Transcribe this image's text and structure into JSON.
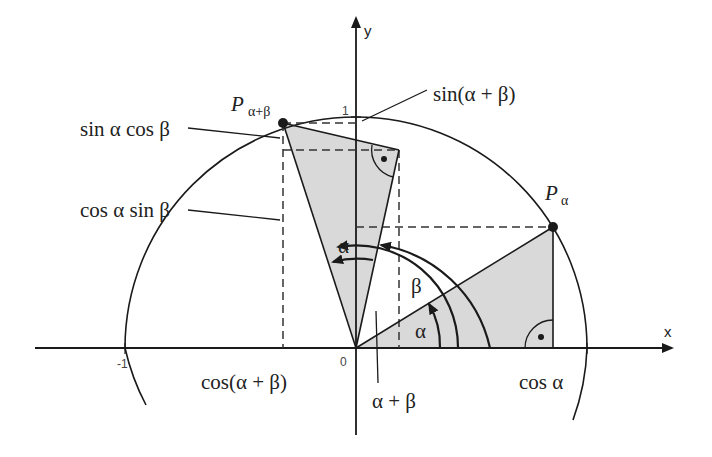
{
  "diagram": {
    "type": "unit-circle-angle-addition",
    "axes": {
      "x_label": "x",
      "y_label": "y"
    },
    "ticks": {
      "origin": "0",
      "x_neg_one": "-1",
      "x_one": "1",
      "y_one": "1"
    },
    "points": {
      "p_alpha": {
        "base": "P",
        "subscript": "α"
      },
      "p_alpha_beta": {
        "base": "P",
        "subscript": "α+β"
      }
    },
    "labels": {
      "sin_alpha_cos_beta": "sin α cos β",
      "cos_alpha_sin_beta": "cos α sin β",
      "sin_alpha_plus_beta": "sin(α + β)",
      "cos_alpha_plus_beta": "cos(α + β)",
      "cos_alpha": "cos α",
      "alpha_plus_beta": "α + β",
      "angle_alpha_lower": "α",
      "angle_alpha_upper": "α",
      "angle_beta": "β"
    },
    "angles_deg": {
      "alpha": 31.6,
      "alpha_plus_beta": 108.4
    },
    "colors": {
      "stroke": "#1a1a1a",
      "fill": "#d9d9d9",
      "dashed": "#333333"
    }
  }
}
